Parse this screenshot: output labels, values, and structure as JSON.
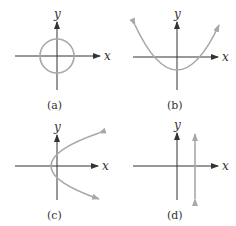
{
  "panels": [
    {
      "id": "a",
      "caption": "(a)",
      "x_label": "x",
      "y_label": "y",
      "graph": "circle centered at origin"
    },
    {
      "id": "b",
      "caption": "(b)",
      "x_label": "x",
      "y_label": "y",
      "graph": "upward-opening parabola, vertex below origin"
    },
    {
      "id": "c",
      "caption": "(c)",
      "x_label": "x",
      "y_label": "y",
      "graph": "rightward-opening parabola, vertex left of origin"
    },
    {
      "id": "d",
      "caption": "(d)",
      "x_label": "x",
      "y_label": "y",
      "graph": "vertical line right of y-axis"
    }
  ],
  "colors": {
    "axis": "#333333",
    "curve": "#a8a8a8",
    "background": "#ffffff"
  }
}
